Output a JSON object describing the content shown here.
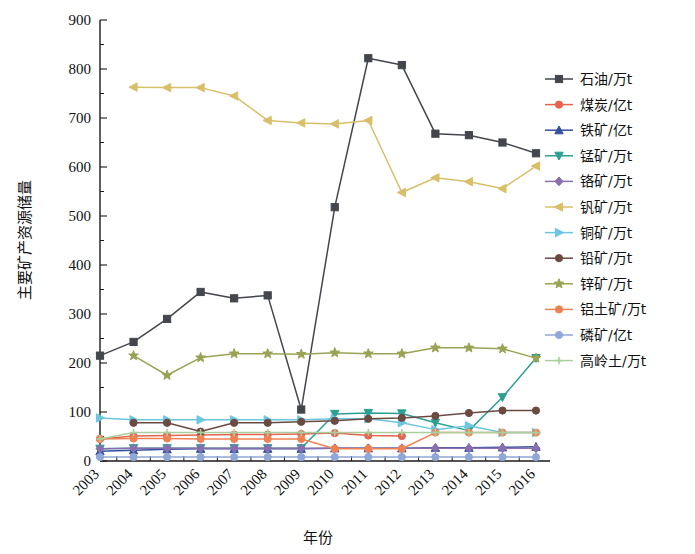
{
  "chart_data": {
    "type": "line",
    "title": "",
    "xlabel": "年份",
    "ylabel": "主要矿产资源储量",
    "grid": false,
    "legend_position": "right",
    "xlim": [
      2003,
      2016
    ],
    "ylim": [
      0,
      900
    ],
    "ytick_step": 100,
    "yticks": [
      0,
      100,
      200,
      300,
      400,
      500,
      600,
      700,
      800,
      900
    ],
    "categories": [
      2003,
      2004,
      2005,
      2006,
      2007,
      2008,
      2009,
      2010,
      2011,
      2012,
      2013,
      2014,
      2015,
      2016
    ],
    "xticklabels": [
      "2003",
      "2004",
      "2005",
      "2006",
      "2007",
      "2008",
      "2009",
      "2010",
      "2011",
      "2012",
      "2013",
      "2014",
      "2015",
      "2016"
    ],
    "series": [
      {
        "name": "石油/万t",
        "color": "#44464d",
        "marker": "square",
        "values": [
          215,
          243,
          290,
          345,
          332,
          338,
          105,
          518,
          822,
          808,
          668,
          665,
          650,
          628
        ]
      },
      {
        "name": "煤炭/亿t",
        "color": "#e4644f",
        "marker": "circle",
        "values": [
          45,
          51,
          52,
          53,
          54,
          54,
          55,
          57,
          52,
          51,
          null,
          null,
          null,
          null
        ]
      },
      {
        "name": "铁矿/亿t",
        "color": "#33519e",
        "marker": "triangle-up",
        "values": [
          20,
          22,
          24,
          25,
          25,
          25,
          25,
          26,
          26,
          26,
          27,
          27,
          28,
          29
        ]
      },
      {
        "name": "锰矿/万t",
        "color": "#2aa090",
        "marker": "triangle-down",
        "values": [
          25,
          26,
          26,
          26,
          26,
          26,
          26,
          96,
          98,
          97,
          78,
          62,
          130,
          210
        ]
      },
      {
        "name": "铬矿/万t",
        "color": "#8a6fb0",
        "marker": "diamond",
        "values": [
          25,
          26,
          26,
          26,
          26,
          26,
          26,
          26,
          26,
          26,
          26,
          26,
          26,
          26
        ]
      },
      {
        "name": "钒矿/万t",
        "color": "#d8c06a",
        "marker": "triangle-left",
        "values": [
          null,
          763,
          762,
          762,
          745,
          695,
          690,
          688,
          695,
          548,
          578,
          570,
          556,
          602
        ]
      },
      {
        "name": "铜矿/万t",
        "color": "#6dc6e0",
        "marker": "triangle-right",
        "values": [
          88,
          84,
          84,
          84,
          84,
          84,
          84,
          86,
          86,
          78,
          64,
          72,
          58,
          58
        ]
      },
      {
        "name": "铅矿/万t",
        "color": "#6b4a42",
        "marker": "circle",
        "values": [
          null,
          78,
          78,
          60,
          78,
          78,
          80,
          82,
          86,
          88,
          92,
          98,
          103,
          103
        ]
      },
      {
        "name": "锌矿/万t",
        "color": "#9aa355",
        "marker": "star",
        "values": [
          null,
          215,
          175,
          211,
          219,
          219,
          218,
          221,
          219,
          219,
          231,
          231,
          229,
          210
        ]
      },
      {
        "name": "铝土矿/万t",
        "color": "#ef8254",
        "marker": "circle",
        "values": [
          45,
          46,
          46,
          45,
          45,
          45,
          45,
          25,
          25,
          25,
          58,
          58,
          58,
          58
        ]
      },
      {
        "name": "磷矿/亿t",
        "color": "#8fa8d8",
        "marker": "circle",
        "values": [
          8,
          8,
          8,
          8,
          8,
          8,
          8,
          8,
          8,
          8,
          8,
          8,
          8,
          8
        ]
      },
      {
        "name": "高岭土/万t",
        "color": "#a9cf9e",
        "marker": "plus",
        "values": [
          45,
          58,
          58,
          58,
          58,
          58,
          58,
          58,
          58,
          58,
          58,
          58,
          58,
          58
        ]
      }
    ]
  }
}
